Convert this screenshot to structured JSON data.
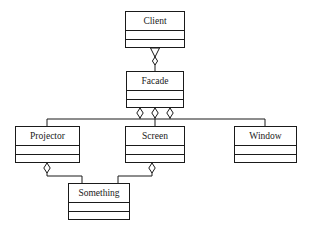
{
  "diagram": {
    "kind": "uml-class-diagram",
    "pattern": "Facade",
    "background_color": "#ffffff",
    "line_color": "#1a1a1a",
    "text_color": "#1a1a1a",
    "classes": [
      {
        "id": "client",
        "name": "Client",
        "x": 125,
        "y": 11,
        "w": 60,
        "h": 37,
        "compartments": [
          "attributes",
          "operations"
        ]
      },
      {
        "id": "facade",
        "name": "Facade",
        "x": 126,
        "y": 71,
        "w": 58,
        "h": 37,
        "compartments": [
          "attributes",
          "operations"
        ]
      },
      {
        "id": "projector",
        "name": "Projector",
        "x": 15,
        "y": 126,
        "w": 65,
        "h": 37,
        "compartments": [
          "attributes",
          "operations"
        ]
      },
      {
        "id": "screen",
        "name": "Screen",
        "x": 125,
        "y": 126,
        "w": 60,
        "h": 37,
        "compartments": [
          "attributes",
          "operations"
        ]
      },
      {
        "id": "window",
        "name": "Window",
        "x": 234,
        "y": 126,
        "w": 63,
        "h": 37,
        "compartments": [
          "attributes",
          "operations"
        ]
      },
      {
        "id": "something",
        "name": "Something",
        "x": 68,
        "y": 183,
        "w": 62,
        "h": 37,
        "compartments": [
          "attributes",
          "operations"
        ]
      }
    ],
    "relationships": [
      {
        "id": "client-facade",
        "from": "client",
        "to": "facade",
        "type": "association-with-triangle",
        "source_adornment": "hollow-triangle-down",
        "target_adornment": "hollow-diamond"
      },
      {
        "id": "facade-projector",
        "from": "facade",
        "to": "projector",
        "type": "aggregation",
        "source_adornment": "hollow-diamond"
      },
      {
        "id": "facade-screen",
        "from": "facade",
        "to": "screen",
        "type": "aggregation",
        "source_adornment": "hollow-diamond"
      },
      {
        "id": "facade-window",
        "from": "facade",
        "to": "window",
        "type": "aggregation",
        "source_adornment": "hollow-diamond"
      },
      {
        "id": "projector-something",
        "from": "projector",
        "to": "something",
        "type": "aggregation",
        "source_adornment": "hollow-diamond"
      },
      {
        "id": "screen-something",
        "from": "screen",
        "to": "something",
        "type": "aggregation",
        "source_adornment": "hollow-diamond"
      }
    ]
  }
}
